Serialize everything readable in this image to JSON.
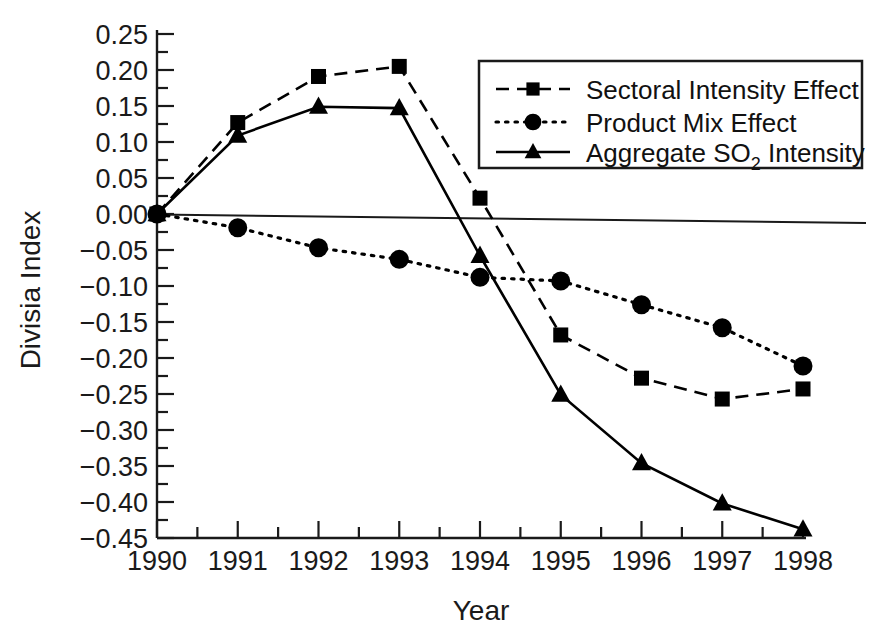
{
  "chart_data": {
    "type": "line",
    "title": "",
    "xlabel": "Year",
    "ylabel": "Divisia Index",
    "x": [
      1990,
      1991,
      1992,
      1993,
      1994,
      1995,
      1996,
      1997,
      1998
    ],
    "xticklabels": [
      "1990",
      "1991",
      "1992",
      "1993",
      "1994",
      "1995",
      "1996",
      "1997",
      "1998"
    ],
    "yticklabels": [
      "0.25",
      "0.20",
      "0.15",
      "0.10",
      "0.05",
      "0.00",
      "−0.05",
      "−0.10",
      "−0.15",
      "−0.20",
      "−0.25",
      "−0.30",
      "−0.35",
      "−0.40",
      "−0.45"
    ],
    "ytickvalues": [
      0.25,
      0.2,
      0.15,
      0.1,
      0.05,
      0.0,
      -0.05,
      -0.1,
      -0.15,
      -0.2,
      -0.25,
      -0.3,
      -0.35,
      -0.4,
      -0.45
    ],
    "xlim": [
      1990,
      1998
    ],
    "ylim": [
      -0.45,
      0.25
    ],
    "grid": false,
    "minor_ticks": true,
    "zero_reference_line": true,
    "legend_position": "upper-right",
    "series": [
      {
        "name": "Sectoral Intensity Effect",
        "marker": "square",
        "linestyle": "dashed",
        "color": "#000000",
        "values": [
          0.0,
          0.127,
          0.191,
          0.205,
          0.022,
          -0.168,
          -0.228,
          -0.257,
          -0.243
        ]
      },
      {
        "name": "Product Mix Effect",
        "marker": "circle",
        "linestyle": "dotted",
        "color": "#000000",
        "values": [
          0.0,
          -0.019,
          -0.047,
          -0.063,
          -0.088,
          -0.093,
          -0.126,
          -0.158,
          -0.211
        ]
      },
      {
        "name": "Aggregate SO2 Intensity",
        "marker": "triangle",
        "linestyle": "solid",
        "color": "#000000",
        "values": [
          0.0,
          0.109,
          0.149,
          0.147,
          -0.058,
          -0.251,
          -0.346,
          -0.402,
          -0.438
        ]
      }
    ]
  },
  "legend": {
    "items": [
      {
        "label": "Sectoral Intensity Effect",
        "sub": "",
        "tail": ""
      },
      {
        "label": "Product Mix Effect",
        "sub": "",
        "tail": ""
      },
      {
        "label": "Aggregate SO",
        "sub": "2",
        "tail": " Intensity"
      }
    ]
  },
  "axes": {
    "x_title": "Year",
    "y_title": "Divisia Index"
  }
}
